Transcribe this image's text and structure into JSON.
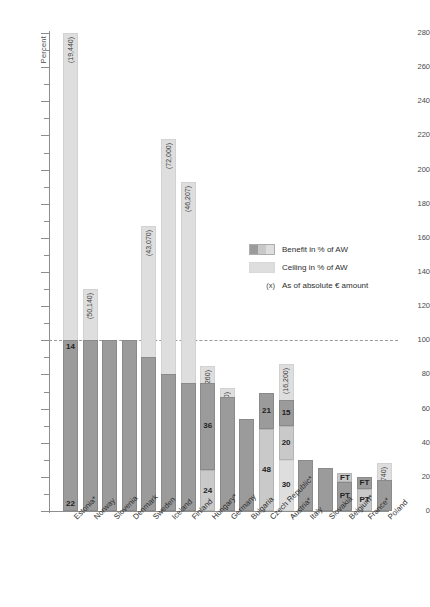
{
  "chart_data": {
    "type": "bar",
    "title": "",
    "xlabel": "",
    "ylabel": "Percent",
    "ylim": [
      0,
      280
    ],
    "ytick_step": 20,
    "yminor_step": 10,
    "grid": false,
    "reference_line": 100,
    "ytick_labels": [
      "0",
      "20",
      "40",
      "60",
      "80",
      "100",
      "120",
      "140",
      "160",
      "180",
      "200",
      "220",
      "240",
      "260",
      "280"
    ],
    "categories": [
      "Estonia*",
      "Norway",
      "Slovenia",
      "Denmark",
      "Sweden",
      "Iceland",
      "Finland",
      "Hungary*",
      "Germany",
      "Bulgaria",
      "Czech Republic*",
      "Austria*",
      "Italy",
      "Slovakia",
      "Belgium*",
      "France*",
      "Poland"
    ],
    "series": [
      {
        "name": "Benefit in % of AW",
        "values": [
          100,
          100,
          100,
          100,
          90,
          80,
          75,
          75,
          67,
          54,
          69,
          65,
          30,
          25,
          22,
          20,
          18
        ]
      },
      {
        "name": "Ceiling in % of AW",
        "values": [
          280,
          130,
          null,
          null,
          167,
          218,
          193,
          85,
          72,
          null,
          null,
          86,
          null,
          null,
          null,
          null,
          28
        ]
      }
    ],
    "bars": [
      {
        "category": "Estonia*",
        "ceiling": 280,
        "ceiling_label": "(19,440)",
        "segments": [
          {
            "from": 0,
            "to": 100,
            "style": "benefit",
            "label_top": "14",
            "label_bottom": "22"
          }
        ]
      },
      {
        "category": "Norway",
        "ceiling": 130,
        "ceiling_label": "(50,140)",
        "segments": [
          {
            "from": 0,
            "to": 100,
            "style": "benefit",
            "label": ""
          }
        ]
      },
      {
        "category": "Slovenia",
        "ceiling": null,
        "ceiling_label": "",
        "segments": [
          {
            "from": 0,
            "to": 100,
            "style": "benefit",
            "label": ""
          }
        ]
      },
      {
        "category": "Denmark",
        "ceiling": null,
        "ceiling_label": "",
        "segments": [
          {
            "from": 0,
            "to": 100,
            "style": "benefit",
            "label": ""
          }
        ]
      },
      {
        "category": "Sweden",
        "ceiling": 167,
        "ceiling_label": "(43,070)",
        "segments": [
          {
            "from": 0,
            "to": 90,
            "style": "benefit",
            "label": ""
          }
        ]
      },
      {
        "category": "Iceland",
        "ceiling": 218,
        "ceiling_label": "(72,000)",
        "segments": [
          {
            "from": 0,
            "to": 80,
            "style": "benefit",
            "label": ""
          }
        ]
      },
      {
        "category": "Finland",
        "ceiling": 193,
        "ceiling_label": "(46,207)",
        "segments": [
          {
            "from": 0,
            "to": 75,
            "style": "benefit",
            "label": ""
          }
        ]
      },
      {
        "category": "Hungary*",
        "ceiling": 85,
        "ceiling_label": "(4,260)",
        "segments": [
          {
            "from": 0,
            "to": 24,
            "style": "benefit-lite",
            "label": "24"
          },
          {
            "from": 24,
            "to": 75,
            "style": "benefit",
            "label": "36"
          }
        ]
      },
      {
        "category": "Germany",
        "ceiling": 72,
        "ceiling_label": "(21,600)",
        "segments": [
          {
            "from": 0,
            "to": 67,
            "style": "benefit",
            "label": ""
          }
        ]
      },
      {
        "category": "Bulgaria",
        "ceiling": null,
        "ceiling_label": "",
        "segments": [
          {
            "from": 0,
            "to": 54,
            "style": "benefit",
            "label": ""
          }
        ]
      },
      {
        "category": "Czech Republic*",
        "ceiling": null,
        "ceiling_label": "",
        "segments": [
          {
            "from": 0,
            "to": 48,
            "style": "benefit-lite",
            "label": "48"
          },
          {
            "from": 48,
            "to": 69,
            "style": "benefit",
            "label": "21"
          }
        ]
      },
      {
        "category": "Austria*",
        "ceiling": 86,
        "ceiling_label": "(16,200)",
        "segments": [
          {
            "from": 0,
            "to": 30,
            "style": "ceiling",
            "label": "30"
          },
          {
            "from": 30,
            "to": 50,
            "style": "benefit-lite",
            "label": "20"
          },
          {
            "from": 50,
            "to": 65,
            "style": "benefit",
            "label": "15"
          }
        ]
      },
      {
        "category": "Italy",
        "ceiling": null,
        "ceiling_label": "",
        "segments": [
          {
            "from": 0,
            "to": 30,
            "style": "benefit",
            "label": ""
          }
        ]
      },
      {
        "category": "Slovakia",
        "ceiling": null,
        "ceiling_label": "",
        "segments": [
          {
            "from": 0,
            "to": 25,
            "style": "benefit",
            "label": ""
          }
        ]
      },
      {
        "category": "Belgium*",
        "ceiling": null,
        "ceiling_label": "",
        "segments": [
          {
            "from": 0,
            "to": 17,
            "style": "benefit",
            "label": "PT"
          },
          {
            "from": 17,
            "to": 22,
            "style": "benefit-lite",
            "label": "FT"
          }
        ]
      },
      {
        "category": "France*",
        "ceiling": null,
        "ceiling_label": "",
        "segments": [
          {
            "from": 0,
            "to": 13,
            "style": "benefit-lite",
            "label": "PT"
          },
          {
            "from": 13,
            "to": 20,
            "style": "benefit",
            "label": "FT"
          }
        ]
      },
      {
        "category": "Poland",
        "ceiling": 28,
        "ceiling_label": "(1,740)",
        "segments": [
          {
            "from": 0,
            "to": 18,
            "style": "benefit",
            "label": ""
          }
        ]
      }
    ],
    "legend": {
      "position": "inside-right",
      "entries": [
        {
          "swatch": "benefit",
          "label": "Benefit in % of AW"
        },
        {
          "swatch": "ceiling",
          "label": "Ceiling in % of AW"
        },
        {
          "swatch": "note",
          "marker": "(x)",
          "label": "As of absolute € amount"
        }
      ]
    },
    "colors": {
      "benefit": "#9b9b9b",
      "benefit_light": "#c9c9c9",
      "ceiling": "#dedede",
      "axis": "#8d8d8d",
      "text": "#2e2e2e",
      "background": "#ffffff"
    }
  }
}
